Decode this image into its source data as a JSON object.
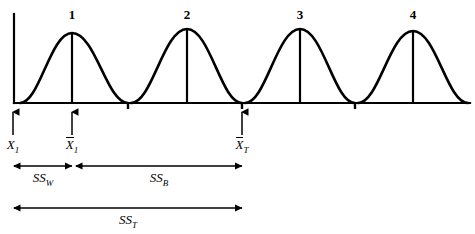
{
  "figure": {
    "line_color": "#000000",
    "background_color": "#ffffff"
  },
  "chart_data": {
    "type": "line",
    "title": "",
    "xlabel": "",
    "ylabel": "",
    "grid": false,
    "legend": "none",
    "axis": {
      "x_start": 14,
      "x_end": 470,
      "baseline_y": 103,
      "y_axis_top": 14
    },
    "curves": [
      {
        "label": "1",
        "peak_x": 72,
        "peak_y": 33,
        "left_x": 20,
        "right_x": 128,
        "mean_line": true
      },
      {
        "label": "2",
        "peak_x": 187,
        "peak_y": 29,
        "left_x": 131,
        "right_x": 242,
        "mean_line": true
      },
      {
        "label": "3",
        "peak_x": 300,
        "peak_y": 29,
        "left_x": 245,
        "right_x": 355,
        "mean_line": true
      },
      {
        "label": "4",
        "peak_x": 413,
        "peak_y": 31,
        "left_x": 358,
        "right_x": 468,
        "mean_line": true
      }
    ],
    "axis_ticks": [
      {
        "x": 128
      },
      {
        "x": 242
      },
      {
        "x": 355
      }
    ],
    "pointers": [
      {
        "x": 13,
        "label": "X",
        "sub": "1",
        "overbar": false
      },
      {
        "x": 72,
        "label": "X",
        "sub": "1",
        "overbar": true
      },
      {
        "x": 242,
        "label": "X",
        "sub": "T",
        "overbar": true
      }
    ],
    "measures": [
      {
        "name": "SS",
        "sub": "W",
        "x_from": 14,
        "x_to": 72,
        "y": 166,
        "label_x": 43,
        "label_y": 170
      },
      {
        "name": "SS",
        "sub": "B",
        "x_from": 76,
        "x_to": 242,
        "y": 166,
        "label_x": 159,
        "label_y": 170
      },
      {
        "name": "SS",
        "sub": "T",
        "x_from": 14,
        "x_to": 242,
        "y": 208,
        "label_x": 128,
        "label_y": 212
      }
    ]
  }
}
